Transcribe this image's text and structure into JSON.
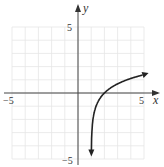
{
  "chart_data": {
    "type": "line",
    "title": "",
    "xlabel": "x",
    "ylabel": "y",
    "xlim": [
      -5,
      5
    ],
    "ylim": [
      -5,
      5
    ],
    "grid": true,
    "tick_labels": {
      "x_min": "−5",
      "x_max": "5",
      "y_max": "5",
      "y_min": "−5"
    },
    "series": [
      {
        "name": "curve",
        "description": "logarithmic curve, vertical asymptote near x=1, x-intercept at x=2",
        "x": [
          1.05,
          1.1,
          1.2,
          1.5,
          2,
          3,
          4,
          5
        ],
        "y": [
          -4.6,
          -3.6,
          -2.6,
          -1.0,
          0,
          0.69,
          1.1,
          1.39
        ]
      }
    ]
  },
  "colors": {
    "grid": "#e4e4e4",
    "axis": "#444444",
    "curve": "#222222"
  }
}
